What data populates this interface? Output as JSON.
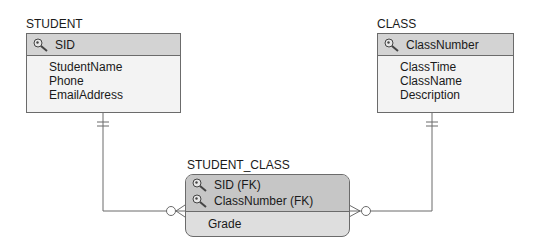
{
  "entities": {
    "student": {
      "title": "STUDENT",
      "key_icon": "key-icon",
      "primary_key": "SID",
      "attributes": [
        "StudentName",
        "Phone",
        "EmailAddress"
      ]
    },
    "class": {
      "title": "CLASS",
      "key_icon": "key-icon",
      "primary_key": "ClassNumber",
      "attributes": [
        "ClassTime",
        "ClassName",
        "Description"
      ]
    },
    "student_class": {
      "title": "STUDENT_CLASS",
      "key_icon": "key-icon",
      "primary_keys": [
        "SID (FK)",
        "ClassNumber (FK)"
      ],
      "attributes": [
        "Grade"
      ]
    }
  },
  "relationships": [
    {
      "from": "STUDENT",
      "to": "STUDENT_CLASS",
      "from_cardinality": "exactly-one",
      "to_cardinality": "zero-or-many"
    },
    {
      "from": "CLASS",
      "to": "STUDENT_CLASS",
      "from_cardinality": "exactly-one",
      "to_cardinality": "zero-or-many"
    }
  ],
  "colors": {
    "header_fill": "#d3d3d3",
    "body_fill": "#f3f3f3",
    "weak_header_fill": "#c6c6c6",
    "weak_body_fill": "#dedede",
    "line": "#6b6b6b"
  }
}
